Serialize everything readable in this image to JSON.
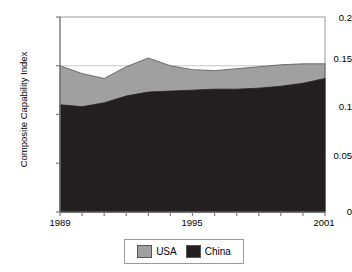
{
  "chart_data": {
    "type": "area",
    "stacked": true,
    "title": "",
    "subtitle": "",
    "xlabel": "",
    "ylabel": "Composite Capability Index",
    "x": [
      1989,
      1990,
      1991,
      1992,
      1993,
      1994,
      1995,
      1996,
      1997,
      1998,
      1999,
      2000,
      2001
    ],
    "categories": [
      "1989",
      "1990",
      "1991",
      "1992",
      "1993",
      "1994",
      "1995",
      "1996",
      "1997",
      "1998",
      "1999",
      "2000",
      "2001"
    ],
    "series": [
      {
        "name": "China",
        "color": "#231f20",
        "values": [
          0.11,
          0.108,
          0.112,
          0.119,
          0.123,
          0.124,
          0.125,
          0.126,
          0.126,
          0.127,
          0.129,
          0.132,
          0.137
        ]
      },
      {
        "name": "USA",
        "color": "#a0a0a0",
        "values": [
          0.04,
          0.034,
          0.025,
          0.03,
          0.035,
          0.026,
          0.021,
          0.019,
          0.021,
          0.022,
          0.022,
          0.02,
          0.015
        ]
      }
    ],
    "totals": [
      0.15,
      0.142,
      0.137,
      0.149,
      0.158,
      0.15,
      0.146,
      0.145,
      0.147,
      0.149,
      0.151,
      0.152,
      0.152
    ],
    "ylim": [
      0,
      0.2
    ],
    "yticks": [
      0,
      0.05,
      0.1,
      0.15,
      0.2
    ],
    "ytick_labels": [
      "0",
      "0.05",
      "0.1",
      "0.15",
      "0.2"
    ],
    "xlim": [
      1989,
      2001
    ],
    "xticks": [
      1989,
      1990,
      1991,
      1992,
      1993,
      1994,
      1995,
      1996,
      1997,
      1998,
      1999,
      2000,
      2001
    ],
    "xtick_labels_shown": [
      "1989",
      "1995",
      "2001"
    ],
    "grid": false,
    "legend_position": "bottom",
    "legend": [
      {
        "label": "USA",
        "color": "#a0a0a0"
      },
      {
        "label": "China",
        "color": "#231f20"
      }
    ]
  },
  "axes": {
    "y_title": "Composite Capability Index",
    "y_ticks": [
      {
        "value": 0.2,
        "label": "0.2"
      },
      {
        "value": 0.15,
        "label": "0.15"
      },
      {
        "value": 0.1,
        "label": "0.1"
      },
      {
        "value": 0.05,
        "label": "0.05"
      },
      {
        "value": 0,
        "label": "0"
      }
    ],
    "x_ticks": [
      {
        "value": 1989,
        "label": "1989"
      },
      {
        "value": 1995,
        "label": "1995"
      },
      {
        "value": 2001,
        "label": "2001"
      }
    ]
  },
  "legend": {
    "usa_label": "USA",
    "china_label": "China"
  },
  "colors": {
    "usa": "#a0a0a0",
    "china": "#231f20",
    "axis": "#7d7d7d",
    "plot_border": "#9a9a9a",
    "background": "#ffffff",
    "text": "#000000"
  }
}
